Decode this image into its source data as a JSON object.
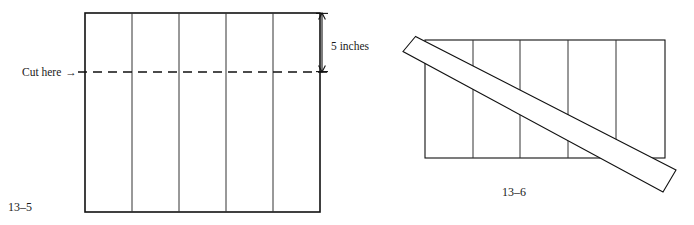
{
  "plate": {
    "width": 694,
    "height": 225,
    "background": "#ffffff",
    "ink_color": "#111111"
  },
  "figures": [
    {
      "id": "figure-13-5",
      "caption": "13–5",
      "caption_x": 8,
      "caption_y": 211,
      "description": "Rectangular sheet divided into five vertical strips, with a horizontal dashed cut line and a 5 inches dimension arrow at the right side.",
      "sheet": {
        "left": 85,
        "top": 13,
        "right": 320,
        "bottom": 212,
        "column_count": 5,
        "divider_x": [
          132,
          179,
          226,
          273
        ]
      },
      "cut_line": {
        "label": "Cut here",
        "arrow_glyph": "→",
        "label_x": 22,
        "label_y": 76,
        "y": 72,
        "x_start": 78,
        "x_end": 327
      },
      "dimension": {
        "label": "5 inches",
        "label_x": 331,
        "label_y": 50,
        "arrow_x": 322,
        "arrow_top": 13,
        "arrow_bottom": 72
      }
    },
    {
      "id": "figure-13-6",
      "caption": "13–6",
      "caption_x": 502,
      "caption_y": 196,
      "description": "The same five-strip rectangular sheet with a long diagonal strip laid across it from upper left to lower right.",
      "sheet": {
        "left": 425,
        "top": 40,
        "right": 665,
        "bottom": 158,
        "column_count": 5,
        "divider_x": [
          473,
          520,
          568,
          616
        ]
      },
      "diagonal_strip": {
        "points": "415.5,36.5 403,51.5 663,192 676,170",
        "angle_note": "runs from upper-left to lower-right across the sheet"
      }
    }
  ],
  "chart_data": {
    "type": "diagram",
    "annotations": [
      "Cut here →",
      "5 inches",
      "13–5",
      "13–6"
    ],
    "measurements": [
      {
        "name": "sheet height above cut",
        "value": 5,
        "unit": "inches"
      }
    ],
    "objects": [
      {
        "name": "sheet-13-5",
        "shape": "rectangle",
        "strips": 5,
        "cut": "horizontal dashed line 5 inches below top edge"
      },
      {
        "name": "sheet-13-6",
        "shape": "rectangle",
        "strips": 5
      },
      {
        "name": "diagonal-strip-13-6",
        "shape": "parallelogram",
        "placement": "overlaid diagonally across sheet-13-6"
      }
    ]
  }
}
